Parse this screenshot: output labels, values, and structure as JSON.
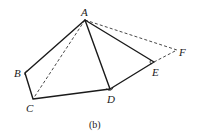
{
  "figure": {
    "caption": "(b)",
    "points": {
      "A": {
        "label": "A",
        "x": 85,
        "y": 20
      },
      "B": {
        "label": "B",
        "x": 25,
        "y": 73
      },
      "C": {
        "label": "C",
        "x": 33,
        "y": 99
      },
      "D": {
        "label": "D",
        "x": 110,
        "y": 89
      },
      "E": {
        "label": "E",
        "x": 154,
        "y": 62
      },
      "F": {
        "label": "F",
        "x": 177,
        "y": 50
      }
    },
    "solid_segments": [
      "AB",
      "BC",
      "CD",
      "DE",
      "EA",
      "AD"
    ],
    "dashed_segments": [
      "AC",
      "AF",
      "EF"
    ],
    "angle_marks": [
      "B",
      "D",
      "E"
    ],
    "colors": {
      "line": "#1a1a1a",
      "background": "#ffffff"
    }
  }
}
